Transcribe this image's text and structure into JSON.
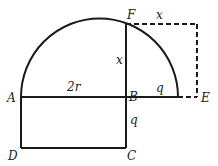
{
  "diagram": {
    "points": {
      "A": "A",
      "B": "B",
      "C": "C",
      "D": "D",
      "E": "E",
      "F": "F"
    },
    "segment_labels": {
      "AB": "2r",
      "BF": "x",
      "F_top": "x",
      "B_right": "q",
      "BC": "q"
    },
    "colors": {
      "stroke": "#1a1a1a",
      "background": "#ffffff"
    }
  }
}
